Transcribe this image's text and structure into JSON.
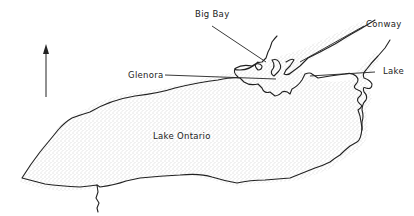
{
  "map": {
    "title": "Lake Ontario",
    "labels": {
      "lake_ontario": "Lake Ontario",
      "big_bay": "Big Bay",
      "conway": "Conway",
      "glenora": "Glenora",
      "lake": "Lake"
    },
    "north_arrow": "north-arrow",
    "colors": {
      "shoreline": "#222222",
      "stipple": "#888888",
      "background": "#ffffff"
    }
  }
}
